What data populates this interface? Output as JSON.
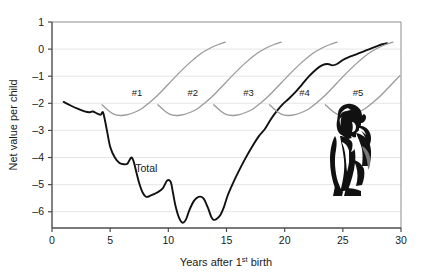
{
  "chart_data": {
    "type": "line",
    "title": "",
    "xlabel": "Years after 1st birth",
    "xlabel_main": "Years after 1",
    "xlabel_sup": "st",
    "xlabel_tail": " birth",
    "ylabel": "Net value per child",
    "xlim": [
      0,
      30
    ],
    "ylim": [
      -6.6,
      1
    ],
    "xticks": [
      0,
      5,
      10,
      15,
      20,
      25,
      30
    ],
    "xtick_labels": [
      "0",
      "5",
      "10",
      "15",
      "20",
      "25",
      "30"
    ],
    "yticks": [
      1,
      0,
      -1,
      -2,
      -3,
      -4,
      -5,
      -6
    ],
    "ytick_labels": [
      "1",
      "0",
      "–1",
      "–2",
      "–3",
      "–4",
      "–5",
      "–6"
    ],
    "grid": "horizontal",
    "legend_position": "inline-annotations",
    "colors": {
      "total_line": "#111111",
      "child_line": "#9a9a9a",
      "grid": "#e6e6e6",
      "axis": "#4d4d4d",
      "text": "#1a1a1a"
    },
    "annotations": [
      {
        "name": "total-label",
        "text": "Total",
        "x": 8.1,
        "y": -4.55
      },
      {
        "name": "child-1-label",
        "text": "#1",
        "x": 7.3,
        "y": -1.72
      },
      {
        "name": "child-2-label",
        "text": "#2",
        "x": 12.1,
        "y": -1.72
      },
      {
        "name": "child-3-label",
        "text": "#3",
        "x": 16.9,
        "y": -1.72
      },
      {
        "name": "child-4-label",
        "text": "#4",
        "x": 21.7,
        "y": -1.72
      },
      {
        "name": "child-5-label",
        "text": "#5",
        "x": 26.3,
        "y": -1.72
      },
      {
        "name": "mother-child-illustration",
        "text": "",
        "x": 25.5,
        "y": -4.1
      }
    ],
    "series": [
      {
        "name": "Total",
        "color": "#111111",
        "x": [
          1.0,
          1.6,
          2.2,
          2.8,
          3.2,
          3.5,
          3.8,
          4.0,
          4.2,
          4.4,
          4.7,
          5.0,
          5.4,
          5.8,
          6.2,
          6.5,
          6.8,
          7.0,
          7.2,
          7.5,
          7.8,
          8.1,
          8.5,
          9.0,
          9.5,
          9.9,
          10.2,
          10.4,
          10.6,
          10.9,
          11.2,
          11.5,
          11.8,
          12.2,
          12.6,
          13.0,
          13.4,
          13.7,
          13.9,
          14.2,
          14.5,
          14.8,
          15.1,
          15.5,
          16.0,
          16.6,
          17.2,
          17.8,
          18.3,
          18.8,
          19.3,
          19.8,
          20.3,
          20.9,
          21.5,
          22.1,
          22.7,
          23.2,
          23.7,
          24.1,
          24.5,
          25.0,
          25.5,
          26.1,
          26.7,
          27.3,
          27.9,
          28.4,
          28.8
        ],
        "y": [
          -1.95,
          -2.08,
          -2.2,
          -2.3,
          -2.33,
          -2.3,
          -2.36,
          -2.4,
          -2.42,
          -2.35,
          -2.95,
          -3.6,
          -4.0,
          -4.2,
          -4.25,
          -4.22,
          -4.0,
          -4.12,
          -4.45,
          -4.95,
          -5.3,
          -5.45,
          -5.4,
          -5.3,
          -5.15,
          -4.85,
          -4.9,
          -5.3,
          -5.75,
          -6.2,
          -6.4,
          -6.3,
          -5.95,
          -5.6,
          -5.45,
          -5.5,
          -5.85,
          -6.2,
          -6.3,
          -6.25,
          -6.1,
          -5.8,
          -5.4,
          -5.0,
          -4.55,
          -4.05,
          -3.6,
          -3.2,
          -2.95,
          -2.6,
          -2.3,
          -2.05,
          -1.85,
          -1.6,
          -1.3,
          -1.0,
          -0.75,
          -0.6,
          -0.55,
          -0.6,
          -0.55,
          -0.4,
          -0.3,
          -0.2,
          -0.1,
          0.0,
          0.1,
          0.18,
          0.22
        ]
      },
      {
        "name": "#1",
        "color": "#9a9a9a",
        "x": [
          4.3,
          4.8,
          5.3,
          5.9,
          6.5,
          7.1,
          7.7,
          8.3,
          8.9,
          9.5,
          10.1,
          10.7,
          11.3,
          11.9,
          12.5,
          13.1,
          13.7,
          14.3,
          14.9
        ],
        "y": [
          -2.05,
          -2.25,
          -2.4,
          -2.45,
          -2.42,
          -2.33,
          -2.2,
          -2.0,
          -1.78,
          -1.52,
          -1.25,
          -0.98,
          -0.72,
          -0.48,
          -0.26,
          -0.08,
          0.06,
          0.17,
          0.26
        ]
      },
      {
        "name": "#2",
        "color": "#9a9a9a",
        "x": [
          9.1,
          9.6,
          10.1,
          10.7,
          11.3,
          11.9,
          12.5,
          13.1,
          13.7,
          14.3,
          14.9,
          15.5,
          16.1,
          16.7,
          17.3,
          17.9,
          18.5,
          19.1,
          19.7
        ],
        "y": [
          -2.05,
          -2.25,
          -2.4,
          -2.45,
          -2.42,
          -2.33,
          -2.2,
          -2.0,
          -1.78,
          -1.52,
          -1.25,
          -0.98,
          -0.72,
          -0.48,
          -0.26,
          -0.08,
          0.06,
          0.17,
          0.26
        ]
      },
      {
        "name": "#3",
        "color": "#9a9a9a",
        "x": [
          13.9,
          14.4,
          14.9,
          15.5,
          16.1,
          16.7,
          17.3,
          17.9,
          18.5,
          19.1,
          19.7,
          20.3,
          20.9,
          21.5,
          22.1,
          22.7,
          23.3,
          23.9,
          24.5
        ],
        "y": [
          -2.05,
          -2.25,
          -2.4,
          -2.45,
          -2.42,
          -2.33,
          -2.2,
          -2.0,
          -1.78,
          -1.52,
          -1.25,
          -0.98,
          -0.72,
          -0.48,
          -0.26,
          -0.08,
          0.06,
          0.17,
          0.26
        ]
      },
      {
        "name": "#4",
        "color": "#9a9a9a",
        "x": [
          18.7,
          19.2,
          19.7,
          20.3,
          20.9,
          21.5,
          22.1,
          22.7,
          23.3,
          23.9,
          24.5,
          25.1,
          25.7,
          26.3,
          26.9,
          27.5,
          28.1,
          28.7,
          29.3
        ],
        "y": [
          -2.05,
          -2.25,
          -2.4,
          -2.45,
          -2.42,
          -2.33,
          -2.2,
          -2.0,
          -1.78,
          -1.52,
          -1.25,
          -0.98,
          -0.72,
          -0.48,
          -0.26,
          -0.08,
          0.06,
          0.17,
          0.26
        ]
      },
      {
        "name": "#5",
        "color": "#9a9a9a",
        "x": [
          23.5,
          24.0,
          24.5,
          25.1,
          25.7,
          26.3,
          26.9,
          27.5,
          28.1,
          28.7,
          29.3,
          29.9
        ],
        "y": [
          -2.05,
          -2.25,
          -2.4,
          -2.45,
          -2.42,
          -2.33,
          -2.2,
          -2.0,
          -1.78,
          -1.52,
          -1.25,
          -0.98
        ]
      }
    ]
  }
}
